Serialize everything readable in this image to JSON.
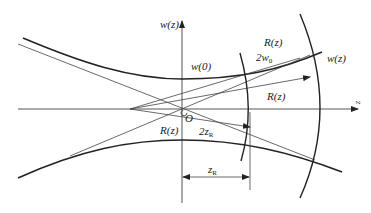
{
  "diagram": {
    "labels": {
      "w_axis": "w(z)",
      "z_axis": "z",
      "w0_label": "w(0)",
      "origin": "O",
      "R_upper": "R(z)",
      "R_mid": "R(z)",
      "R_lower": "R(z)",
      "two_w0_main": "2w",
      "two_w0_sub": "0",
      "wz_right": "w(z)",
      "two_zR_main": "2z",
      "two_zR_sub": "R",
      "zR_main": "z",
      "zR_sub": "R"
    },
    "colors": {
      "stroke": "#222222",
      "thin_stroke": "#444444",
      "background": "#ffffff"
    }
  }
}
